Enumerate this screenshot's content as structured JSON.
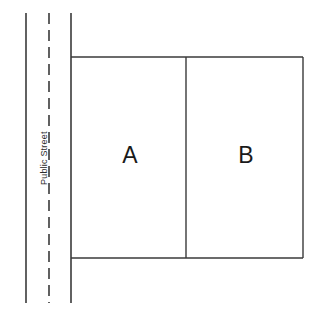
{
  "diagram": {
    "background_color": "#ffffff",
    "line_color": "#3a3a3a",
    "text_color": "#1a1a1a",
    "street": {
      "label": "Public Street",
      "label_rotation_deg": -90,
      "curb_line_name": "street-curb-line",
      "centerline_name": "street-centerline-dashed",
      "frontage_line_name": "lot-frontage-line"
    },
    "lots": [
      {
        "id": "A",
        "label": "A",
        "name": "lot-a"
      },
      {
        "id": "B",
        "label": "B",
        "name": "lot-b"
      }
    ]
  },
  "geometry": {
    "left_curb_x": 26,
    "centerline_x": 49,
    "frontage_x": 71,
    "divider_x": 186,
    "right_edge_x": 303,
    "top_edge_y": 57,
    "bottom_edge_y": 258,
    "street_top_y": 13,
    "street_bottom_y": 303,
    "label_a_x": 130,
    "label_a_y": 155,
    "label_b_x": 246,
    "label_b_y": 155,
    "street_label_x": 40,
    "street_label_y": 185
  }
}
